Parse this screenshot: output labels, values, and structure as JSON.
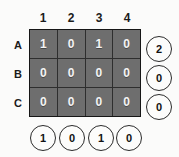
{
  "diagram": {
    "type": "binary-matrix-grid",
    "column_headers": [
      "1",
      "2",
      "3",
      "4"
    ],
    "row_labels": [
      "A",
      "B",
      "C"
    ],
    "cells": [
      [
        "1",
        "0",
        "1",
        "0"
      ],
      [
        "0",
        "0",
        "0",
        "0"
      ],
      [
        "0",
        "0",
        "0",
        "0"
      ]
    ],
    "row_sums": [
      "2",
      "0",
      "0"
    ],
    "column_sums": [
      "1",
      "0",
      "1",
      "0"
    ],
    "colors": {
      "background": "#fbfbfa",
      "cell_fill": "#6e6e6e",
      "cell_text": "#f4f4f4",
      "grid_line": "#2e2e2e",
      "grid_border": "#161616",
      "circle_stroke": "#2b2b2b",
      "circle_fill": "#fcfcfb",
      "label_text": "#1b1b1b"
    }
  }
}
